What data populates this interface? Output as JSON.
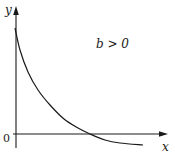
{
  "figure": {
    "condition_label": "b > 0",
    "axis_labels": {
      "x": "x",
      "y": "y",
      "origin": "0"
    },
    "colors": {
      "ink": "#1a1a1a",
      "background": "#ffffff"
    },
    "curve": {
      "description": "Decreasing convex curve starting high on the y-axis, crossing the x-axis, and levelling off below it",
      "type": "exponential-decay-shifted",
      "points_px": [
        [
          15,
          28
        ],
        [
          20,
          50
        ],
        [
          28,
          72
        ],
        [
          38,
          90
        ],
        [
          50,
          105
        ],
        [
          64,
          119
        ],
        [
          78,
          128
        ],
        [
          90,
          134
        ],
        [
          105,
          140
        ],
        [
          120,
          143
        ],
        [
          143,
          145
        ]
      ]
    }
  }
}
